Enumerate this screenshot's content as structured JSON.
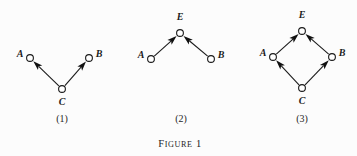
{
  "figure": {
    "caption_main": "FIGURE",
    "caption_number": "1",
    "background_color": "#fcfcfc",
    "ink_color": "#1a1a1a"
  },
  "panels": [
    {
      "label": "(1)",
      "label_x": 62,
      "label_y": 122,
      "nodes": [
        {
          "id": "A",
          "label": "A",
          "cx": 30,
          "cy": 58,
          "r": 3.4,
          "label_x": 20,
          "label_y": 57,
          "label_anchor": "middle"
        },
        {
          "id": "B",
          "label": "B",
          "cx": 89,
          "cy": 58,
          "r": 3.4,
          "label_x": 99,
          "label_y": 57,
          "label_anchor": "middle"
        },
        {
          "id": "C",
          "label": "C",
          "cx": 62,
          "cy": 89,
          "r": 3.4,
          "label_x": 62,
          "label_y": 105,
          "label_anchor": "middle"
        }
      ],
      "edges": [
        {
          "from": "C",
          "to": "A",
          "arrow": "to"
        },
        {
          "from": "C",
          "to": "B",
          "arrow": "to"
        }
      ]
    },
    {
      "label": "(2)",
      "label_x": 181,
      "label_y": 122,
      "nodes": [
        {
          "id": "E",
          "label": "E",
          "cx": 180,
          "cy": 33,
          "r": 3.4,
          "label_x": 180,
          "label_y": 20,
          "label_anchor": "middle"
        },
        {
          "id": "A",
          "label": "A",
          "cx": 151,
          "cy": 59,
          "r": 3.4,
          "label_x": 141,
          "label_y": 58,
          "label_anchor": "middle"
        },
        {
          "id": "B",
          "label": "B",
          "cx": 211,
          "cy": 59,
          "r": 3.4,
          "label_x": 221,
          "label_y": 58,
          "label_anchor": "middle"
        }
      ],
      "edges": [
        {
          "from": "A",
          "to": "E",
          "arrow": "to"
        },
        {
          "from": "B",
          "to": "E",
          "arrow": "to"
        }
      ]
    },
    {
      "label": "(3)",
      "label_x": 302,
      "label_y": 122,
      "nodes": [
        {
          "id": "E",
          "label": "E",
          "cx": 302,
          "cy": 31,
          "r": 3.4,
          "label_x": 302,
          "label_y": 18,
          "label_anchor": "middle"
        },
        {
          "id": "A",
          "label": "A",
          "cx": 273,
          "cy": 57,
          "r": 3.4,
          "label_x": 263,
          "label_y": 56,
          "label_anchor": "middle"
        },
        {
          "id": "B",
          "label": "B",
          "cx": 332,
          "cy": 57,
          "r": 3.4,
          "label_x": 342,
          "label_y": 56,
          "label_anchor": "middle"
        },
        {
          "id": "C",
          "label": "C",
          "cx": 302,
          "cy": 88,
          "r": 3.4,
          "label_x": 302,
          "label_y": 104,
          "label_anchor": "middle"
        }
      ],
      "edges": [
        {
          "from": "C",
          "to": "A",
          "arrow": "to"
        },
        {
          "from": "C",
          "to": "B",
          "arrow": "to"
        },
        {
          "from": "A",
          "to": "E",
          "arrow": "to"
        },
        {
          "from": "B",
          "to": "E",
          "arrow": "to"
        }
      ]
    }
  ],
  "caption": {
    "x": 180,
    "y": 147
  }
}
